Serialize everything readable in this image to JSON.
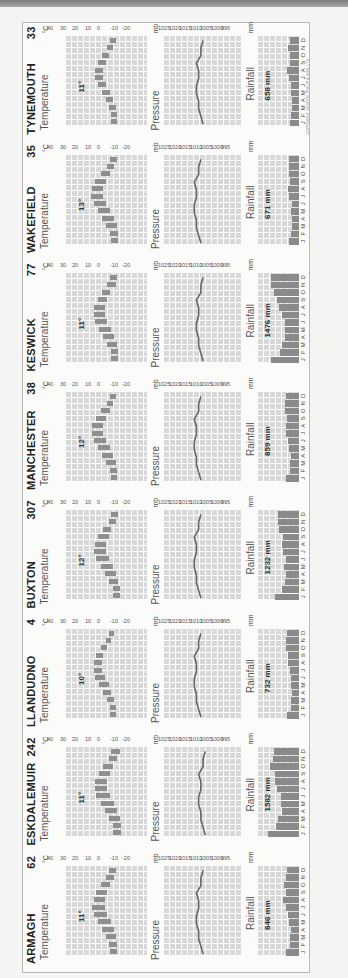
{
  "page": {
    "copyright": "COPYRIGHT GEORGE PHILIP & SON, LTD",
    "colors": {
      "bar": "#8a8a8a",
      "grid_bg": "#d9d9d9",
      "line": "#666666",
      "frame": "#b8b8b8"
    }
  },
  "labels": {
    "temperature": "Temperature",
    "pressure": "Pressure",
    "rainfall": "Rainfall",
    "temp_unit": "°C",
    "pressure_unit": "mb",
    "rain_unit": "mm",
    "temp_ticks": [
      "40",
      "30",
      "20",
      "10",
      "0",
      "-10",
      "-20"
    ],
    "pressure_ticks": [
      "1025",
      "1020",
      "1015",
      "1010",
      "1005",
      "1000",
      "995"
    ],
    "rain_ticks": [
      "250",
      "200",
      "150",
      "100",
      "50",
      "0"
    ],
    "months": [
      "J",
      "F",
      "M",
      "A",
      "M",
      "J",
      "J",
      "A",
      "S",
      "O",
      "N",
      "D"
    ]
  },
  "chart_data": {
    "type": "bar",
    "xlabel": "Month",
    "categories": [
      "J",
      "F",
      "M",
      "A",
      "M",
      "J",
      "J",
      "A",
      "S",
      "O",
      "N",
      "D"
    ],
    "axes": {
      "temperature": {
        "unit": "°C",
        "range": [
          -20,
          40
        ],
        "type": "range-bar (monthly min–max)"
      },
      "pressure": {
        "unit": "mb",
        "range": [
          995,
          1025
        ],
        "type": "line"
      },
      "rainfall": {
        "unit": "mm",
        "range": [
          0,
          250
        ],
        "type": "bar"
      }
    },
    "stations": [
      {
        "name": "ARMAGH",
        "altitude": "62",
        "mean_temp": "11°",
        "total_rain": "846 mm",
        "temp_min": [
          2,
          2,
          3,
          4,
          6,
          9,
          11,
          11,
          9,
          7,
          4,
          3
        ],
        "temp_max": [
          7,
          8,
          10,
          13,
          16,
          19,
          20,
          19,
          17,
          14,
          10,
          8
        ],
        "pressure": [
          1012,
          1013,
          1014,
          1014,
          1015,
          1015,
          1014,
          1014,
          1015,
          1013,
          1013,
          1012
        ],
        "rainfall": [
          80,
          55,
          55,
          50,
          60,
          65,
          80,
          95,
          80,
          90,
          75,
          70
        ]
      },
      {
        "name": "ESKDALEMUIR",
        "altitude": "242",
        "mean_temp": "11°",
        "total_rain": "1582 mm",
        "temp_min": [
          -1,
          -1,
          0,
          2,
          4,
          7,
          9,
          9,
          7,
          5,
          2,
          0
        ],
        "temp_max": [
          5,
          5,
          8,
          11,
          14,
          17,
          18,
          18,
          15,
          12,
          8,
          6
        ],
        "pressure": [
          1011,
          1012,
          1013,
          1013,
          1014,
          1014,
          1013,
          1013,
          1014,
          1012,
          1012,
          1011
        ],
        "rainfall": [
          185,
          135,
          125,
          100,
          105,
          110,
          130,
          140,
          140,
          170,
          155,
          150
        ]
      },
      {
        "name": "LLANDUDNO",
        "altitude": "4",
        "mean_temp": "10°",
        "total_rain": "732 mm",
        "temp_min": [
          3,
          3,
          4,
          6,
          8,
          11,
          13,
          13,
          12,
          9,
          6,
          4
        ],
        "temp_max": [
          7,
          7,
          9,
          12,
          15,
          18,
          19,
          19,
          17,
          14,
          10,
          8
        ],
        "pressure": [
          1013,
          1014,
          1015,
          1015,
          1016,
          1016,
          1015,
          1015,
          1016,
          1014,
          1014,
          1013
        ],
        "rainfall": [
          70,
          50,
          45,
          40,
          45,
          50,
          55,
          65,
          65,
          75,
          75,
          70
        ]
      },
      {
        "name": "BUXTON",
        "altitude": "307",
        "mean_temp": "12°",
        "total_rain": "1232 mm",
        "temp_min": [
          0,
          0,
          1,
          3,
          5,
          8,
          10,
          10,
          8,
          6,
          3,
          1
        ],
        "temp_max": [
          5,
          5,
          8,
          11,
          14,
          17,
          19,
          18,
          16,
          12,
          8,
          6
        ],
        "pressure": [
          1013,
          1014,
          1015,
          1015,
          1016,
          1016,
          1015,
          1015,
          1016,
          1014,
          1014,
          1013
        ],
        "rainfall": [
          145,
          100,
          85,
          80,
          90,
          75,
          95,
          100,
          95,
          120,
          125,
          125
        ]
      },
      {
        "name": "MANCHESTER",
        "altitude": "38",
        "mean_temp": "12°",
        "total_rain": "859 mm",
        "temp_min": [
          2,
          2,
          3,
          5,
          7,
          10,
          12,
          12,
          10,
          7,
          5,
          3
        ],
        "temp_max": [
          6,
          7,
          10,
          13,
          16,
          19,
          20,
          20,
          17,
          14,
          9,
          7
        ],
        "pressure": [
          1013,
          1014,
          1015,
          1015,
          1016,
          1016,
          1015,
          1015,
          1016,
          1014,
          1014,
          1013
        ],
        "rainfall": [
          80,
          55,
          55,
          50,
          60,
          65,
          80,
          80,
          70,
          85,
          85,
          80
        ]
      },
      {
        "name": "KESWICK",
        "altitude": "77",
        "mean_temp": "11°",
        "total_rain": "1476 mm",
        "temp_min": [
          1,
          1,
          2,
          4,
          6,
          9,
          11,
          11,
          9,
          7,
          3,
          2
        ],
        "temp_max": [
          6,
          6,
          9,
          12,
          15,
          18,
          19,
          19,
          16,
          13,
          9,
          7
        ],
        "pressure": [
          1012,
          1013,
          1014,
          1014,
          1015,
          1015,
          1014,
          1014,
          1015,
          1013,
          1013,
          1012
        ],
        "rainfall": [
          165,
          115,
          100,
          85,
          85,
          85,
          100,
          120,
          130,
          150,
          165,
          165
        ]
      },
      {
        "name": "WAKEFIELD",
        "altitude": "35",
        "mean_temp": "13°",
        "total_rain": "671 mm",
        "temp_min": [
          1,
          1,
          2,
          4,
          7,
          10,
          12,
          12,
          10,
          7,
          4,
          2
        ],
        "temp_max": [
          6,
          7,
          10,
          13,
          16,
          19,
          21,
          20,
          18,
          14,
          9,
          7
        ],
        "pressure": [
          1013,
          1014,
          1015,
          1015,
          1016,
          1016,
          1015,
          1015,
          1016,
          1014,
          1014,
          1013
        ],
        "rainfall": [
          60,
          45,
          40,
          40,
          50,
          40,
          60,
          65,
          55,
          60,
          60,
          60
        ]
      },
      {
        "name": "TYNEMOUTH",
        "altitude": "33",
        "mean_temp": "11°",
        "total_rain": "658 mm",
        "temp_min": [
          2,
          2,
          3,
          5,
          7,
          10,
          12,
          12,
          10,
          8,
          5,
          3
        ],
        "temp_max": [
          6,
          6,
          8,
          10,
          13,
          16,
          18,
          18,
          16,
          13,
          9,
          7
        ],
        "pressure": [
          1012,
          1013,
          1014,
          1014,
          1015,
          1015,
          1014,
          1014,
          1015,
          1013,
          1013,
          1012
        ],
        "rainfall": [
          55,
          45,
          40,
          40,
          45,
          45,
          60,
          70,
          55,
          55,
          65,
          55
        ]
      }
    ]
  }
}
